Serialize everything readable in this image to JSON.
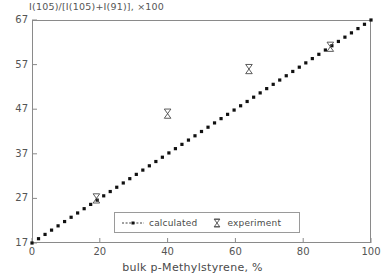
{
  "chart_data": {
    "type": "scatter",
    "title": "",
    "subtitle": "",
    "xlabel": "bulk p-Methylstyrene, %",
    "ylabel": "I(105)/[I(105)+I(91)], ×100",
    "xlim": [
      0,
      100
    ],
    "ylim": [
      17,
      67
    ],
    "xticks": [
      0,
      20,
      40,
      60,
      80,
      100
    ],
    "yticks": [
      17,
      27,
      37,
      47,
      57,
      67
    ],
    "xtick_labels": [
      "0",
      "20",
      "40",
      "60",
      "80",
      "100"
    ],
    "ytick_labels": [
      "17",
      "27",
      "37",
      "47",
      "57",
      "67"
    ],
    "grid": false,
    "legend_position": "lower-center",
    "series": [
      {
        "name": "calculated",
        "marker": "dotted-line",
        "color": "#101010",
        "x": [
          0,
          2,
          4,
          6,
          8,
          10,
          12,
          14,
          16,
          18,
          20,
          22,
          24,
          26,
          28,
          30,
          32,
          34,
          36,
          38,
          40,
          42,
          44,
          46,
          48,
          50,
          52,
          54,
          56,
          58,
          60,
          62,
          64,
          66,
          68,
          70,
          72,
          74,
          76,
          78,
          80,
          82,
          84,
          86,
          88,
          90,
          92,
          94,
          96,
          98,
          100
        ],
        "y": [
          17.0,
          18.0,
          19.0,
          20.0,
          21.0,
          22.0,
          23.0,
          24.0,
          25.0,
          26.0,
          27.0,
          28.0,
          29.0,
          30.0,
          31.0,
          32.0,
          33.0,
          34.0,
          35.0,
          36.0,
          37.0,
          38.0,
          39.0,
          40.0,
          41.0,
          42.0,
          43.0,
          44.0,
          45.0,
          46.0,
          47.0,
          48.0,
          49.0,
          50.0,
          51.0,
          52.0,
          53.0,
          54.0,
          55.0,
          56.0,
          57.0,
          58.0,
          59.0,
          60.0,
          61.0,
          62.0,
          63.0,
          64.0,
          65.0,
          66.0,
          67.0
        ]
      },
      {
        "name": "experiment",
        "marker": "bowtie",
        "color": "#4a4a4a",
        "x": [
          19,
          40,
          64,
          88
        ],
        "y": [
          27,
          46,
          56,
          61
        ]
      }
    ]
  },
  "legend": {
    "items": [
      {
        "label": "calculated",
        "marker": "dotted-line-with-dot"
      },
      {
        "label": "experiment",
        "marker": "bowtie"
      }
    ]
  },
  "axes": {
    "x_title": "bulk p-Methylstyrene, %",
    "y_title": "I(105)/[I(105)+I(91)], ×100"
  }
}
